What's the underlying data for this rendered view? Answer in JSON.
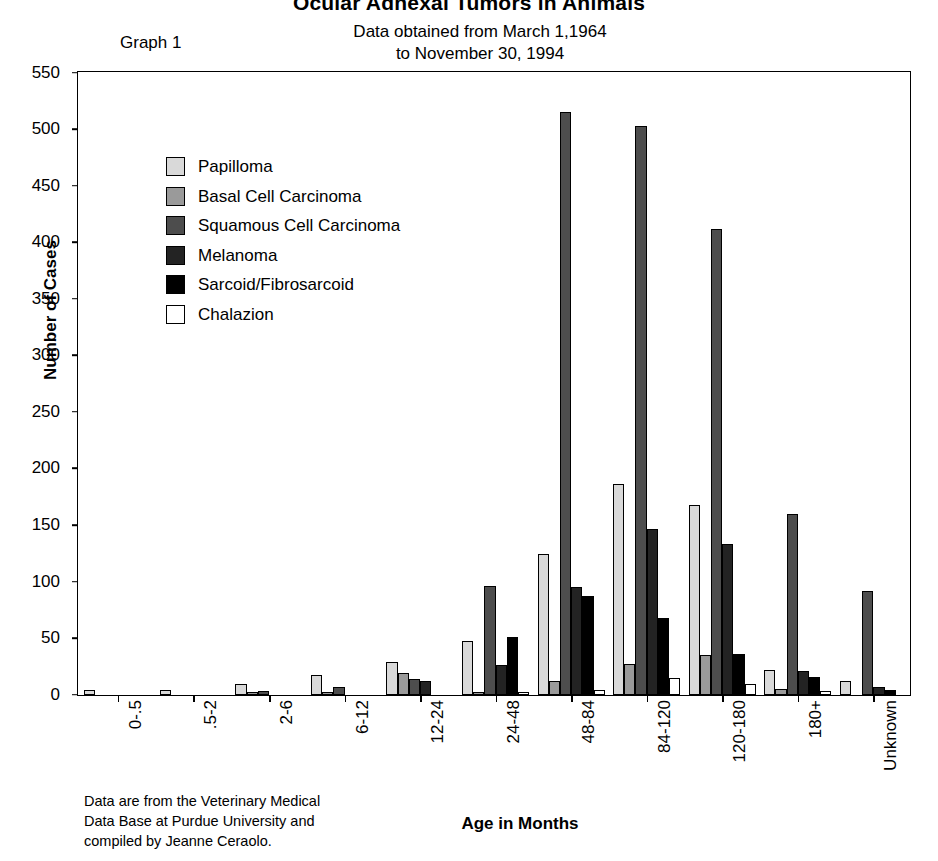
{
  "header": {
    "title": "Ocular Adnexal Tumors in Animals",
    "graph_number": "Graph 1",
    "data_range_line1": "Data obtained from March 1,1964",
    "data_range_line2": "to November 30, 1994"
  },
  "footnote": "Data are from the Veterinary Medical\nData Base at Purdue University and\ncompiled by Jeanne Ceraolo.",
  "colors": {
    "papilloma": "#d9d9d9",
    "basal_cell_carcinoma": "#9a9a9a",
    "squamous_cell_carcinoma": "#4d4d4d",
    "melanoma": "#232323",
    "sarcoid_fibrosarcoid": "#000000",
    "chalazion": "#ffffff",
    "axis": "#000000"
  },
  "chart_data": {
    "type": "bar",
    "title": "Ocular Adnexal Tumors in Animals",
    "subtitle": "Data obtained from March 1,1964 to November 30, 1994",
    "xlabel": "Age in Months",
    "ylabel": "Number of Cases",
    "ylim": [
      0,
      550
    ],
    "yticks": [
      0,
      50,
      100,
      150,
      200,
      250,
      300,
      350,
      400,
      450,
      500,
      550
    ],
    "grid": false,
    "legend_position": "upper-left-inside",
    "categories": [
      "0-.5",
      ".5-2",
      "2-6",
      "6-12",
      "12-24",
      "24-48",
      "48-84",
      "84-120",
      "120-180",
      "180+",
      "Unknown"
    ],
    "series": [
      {
        "name": "Papilloma",
        "values": [
          4,
          4,
          9,
          17,
          29,
          47,
          124,
          186,
          168,
          22,
          12
        ]
      },
      {
        "name": "Basal Cell Carcinoma",
        "values": [
          0,
          0,
          1,
          2,
          19,
          2,
          12,
          27,
          35,
          5,
          0
        ]
      },
      {
        "name": "Squamous Cell Carcinoma",
        "values": [
          0,
          0,
          3,
          7,
          14,
          96,
          515,
          503,
          412,
          160,
          92
        ]
      },
      {
        "name": "Melanoma",
        "values": [
          0,
          0,
          0,
          0,
          12,
          26,
          95,
          146,
          133,
          21,
          7
        ]
      },
      {
        "name": "Sarcoid/Fibrosarcoid",
        "values": [
          0,
          0,
          0,
          0,
          0,
          51,
          87,
          68,
          36,
          16,
          4
        ]
      },
      {
        "name": "Chalazion",
        "values": [
          0,
          0,
          0,
          0,
          0,
          1,
          4,
          15,
          9,
          3,
          0
        ]
      }
    ]
  }
}
